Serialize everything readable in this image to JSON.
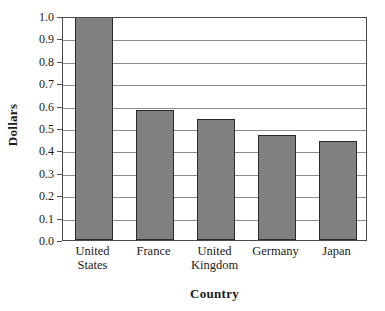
{
  "chart_data": {
    "type": "bar",
    "title": "",
    "xlabel": "Country",
    "ylabel": "Dollars",
    "categories": [
      "United States",
      "France",
      "United Kingdom",
      "Germany",
      "Japan"
    ],
    "category_lines": [
      [
        "United",
        "States"
      ],
      [
        "France",
        ""
      ],
      [
        "United",
        "Kingdom"
      ],
      [
        "Germany",
        ""
      ],
      [
        "Japan",
        ""
      ]
    ],
    "values": [
      1.0,
      0.58,
      0.54,
      0.47,
      0.44
    ],
    "ylim": [
      0.0,
      1.0
    ],
    "ytick_labels": [
      "1.0",
      "0.9",
      "0.8",
      "0.7",
      "0.6",
      "0.5",
      "0.4",
      "0.3",
      "0.2",
      "0.1",
      "0.0"
    ],
    "ytick_values": [
      1.0,
      0.9,
      0.8,
      0.7,
      0.6,
      0.5,
      0.4,
      0.3,
      0.2,
      0.1,
      0.0
    ],
    "grid": true,
    "grid_axis": "y",
    "legend": "none",
    "bar_color": "#808080",
    "bar_border_color": "#2b2b2b",
    "grid_color": "#8c8c8c",
    "frame_color": "#4a4a4a",
    "background_color": "#ffffff"
  }
}
